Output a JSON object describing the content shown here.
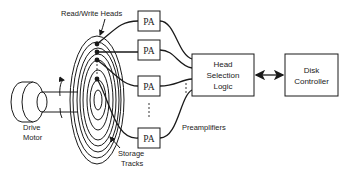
{
  "labels": {
    "read_write_heads": "Read/Write Heads",
    "drive_motor_line1": "Drive",
    "drive_motor_line2": "Motor",
    "storage_tracks_line1": "Storage",
    "storage_tracks_line2": "Tracks",
    "preamplifiers": "Preamplifiers"
  },
  "preamps": [
    {
      "label": "PA"
    },
    {
      "label": "PA"
    },
    {
      "label": "PA"
    },
    {
      "label": "PA"
    }
  ],
  "head_selection_logic": {
    "lines": [
      "Head",
      "Selection",
      "Logic"
    ]
  },
  "disk_controller": {
    "lines": [
      "Disk",
      "Controller"
    ]
  },
  "colors": {
    "stroke": "#1a1a1a",
    "background": "#ffffff"
  }
}
